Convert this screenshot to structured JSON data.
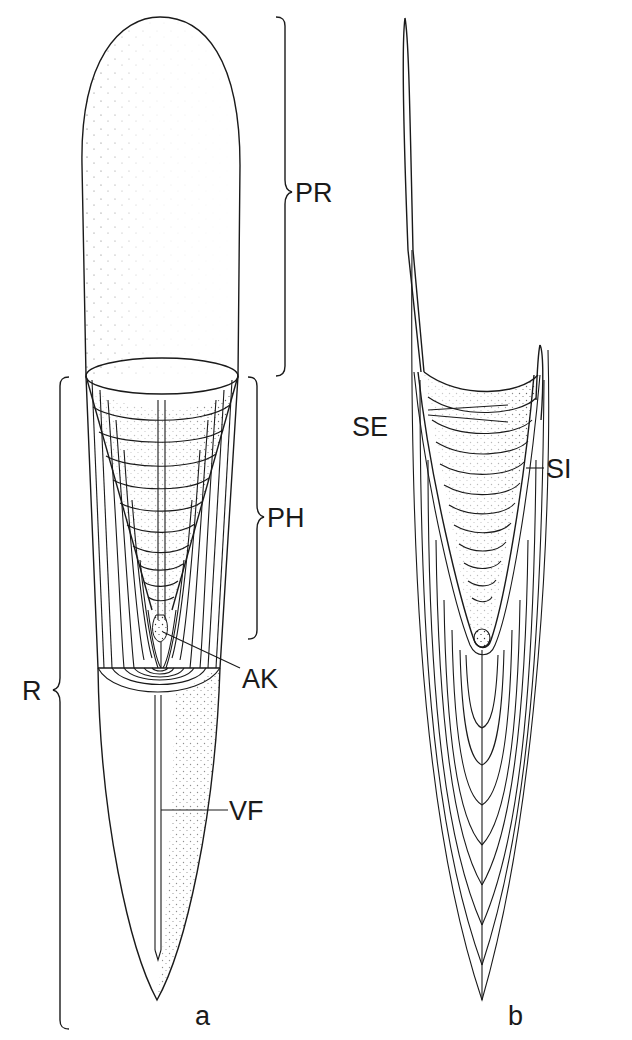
{
  "figure": {
    "panels": [
      {
        "id": "a",
        "label": "a"
      },
      {
        "id": "b",
        "label": "b"
      }
    ],
    "labels": {
      "PR": "PR",
      "PH": "PH",
      "R": "R",
      "AK": "AK",
      "VF": "VF",
      "SE": "SE",
      "SI": "SI"
    },
    "colors": {
      "ink": "#1a1a1a",
      "background": "#ffffff"
    }
  }
}
